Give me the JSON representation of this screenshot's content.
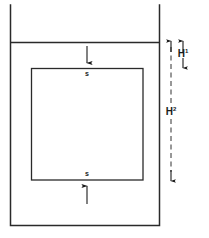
{
  "figure": {
    "stroke_color": "#2a2a2a",
    "background_color": "#ffffff"
  },
  "tank": {
    "name": "tank-outline",
    "left_x": 10,
    "right_x": 160,
    "top_y": 5,
    "bottom_y": 225,
    "wall_thickness": 1.4
  },
  "water_surface": {
    "name": "water-surface-line",
    "y": 42,
    "x_start": 10,
    "x_end": 160
  },
  "block": {
    "name": "immersed-square-block",
    "left_x": 31,
    "right_x": 143,
    "top_y": 68,
    "bottom_y": 180
  },
  "labels": {
    "stress_top": "s",
    "stress_bottom": "s",
    "height_1": "H",
    "height_1_sup": "1",
    "height_2": "H",
    "height_2_sup": "2"
  },
  "arrows": {
    "top_block_arrow": {
      "name": "downward-force-arrow-top",
      "direction": "down",
      "x": 87,
      "y_start": 46,
      "y_end": 64
    },
    "bottom_block_arrow": {
      "name": "upward-force-arrow-bottom",
      "direction": "up",
      "x": 87,
      "y_start": 204,
      "y_end": 184
    }
  },
  "dimensions": {
    "h1": {
      "name": "dimension-h1",
      "x": 183,
      "y_top": 40,
      "y_bottom": 68,
      "style": "double-headed",
      "label": "H1"
    },
    "h2": {
      "name": "dimension-h2",
      "x": 171,
      "y_top": 40,
      "y_bottom": 181,
      "style": "dash-dot double-headed",
      "label": "H2"
    }
  }
}
